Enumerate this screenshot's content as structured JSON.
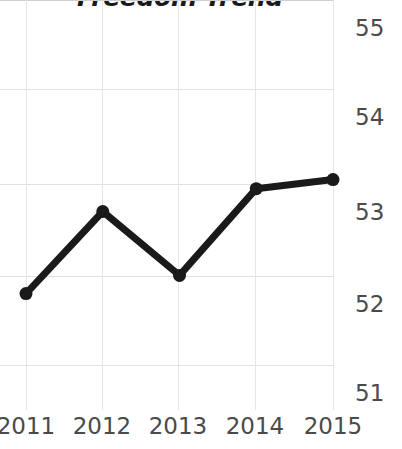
{
  "chart_data": {
    "type": "line",
    "title": "Freedom Trend",
    "xlabel": "",
    "ylabel": "",
    "categories": [
      "2011",
      "2012",
      "2013",
      "2014",
      "2015"
    ],
    "x": [
      2011,
      2012,
      2013,
      2014,
      2015
    ],
    "values": [
      52.1,
      53.0,
      52.3,
      53.25,
      53.35
    ],
    "series": [
      {
        "name": "Freedom Trend",
        "values": [
          52.1,
          53.0,
          52.3,
          53.25,
          53.35
        ]
      }
    ],
    "ylim": [
      51,
      55
    ],
    "xlim": [
      2011,
      2015
    ],
    "yticks": [
      55,
      54,
      53,
      52,
      51
    ],
    "ytick_labels": [
      "55",
      "54",
      "53",
      "52",
      "51"
    ],
    "xticks": [
      2011,
      2012,
      2013,
      2014,
      2015
    ],
    "xtick_labels": [
      "2011",
      "2012",
      "2013",
      "2014",
      "2015"
    ],
    "grid": true,
    "legend": false,
    "legend_position": "none",
    "marker": "circle",
    "colors": {
      "line": "#1a1a1a",
      "marker": "#1a1a1a",
      "grid": "#e2e2e2",
      "axis": "#cfcfcf",
      "tick_label": "#4a4a4a",
      "title": "#1a1a1a",
      "background": "#ffffff"
    },
    "annotations": []
  },
  "axis": {
    "y_labels": [
      "55",
      "54",
      "53",
      "52",
      "51"
    ],
    "x_labels": [
      "2011",
      "2012",
      "2013",
      "2014",
      "2015"
    ]
  }
}
